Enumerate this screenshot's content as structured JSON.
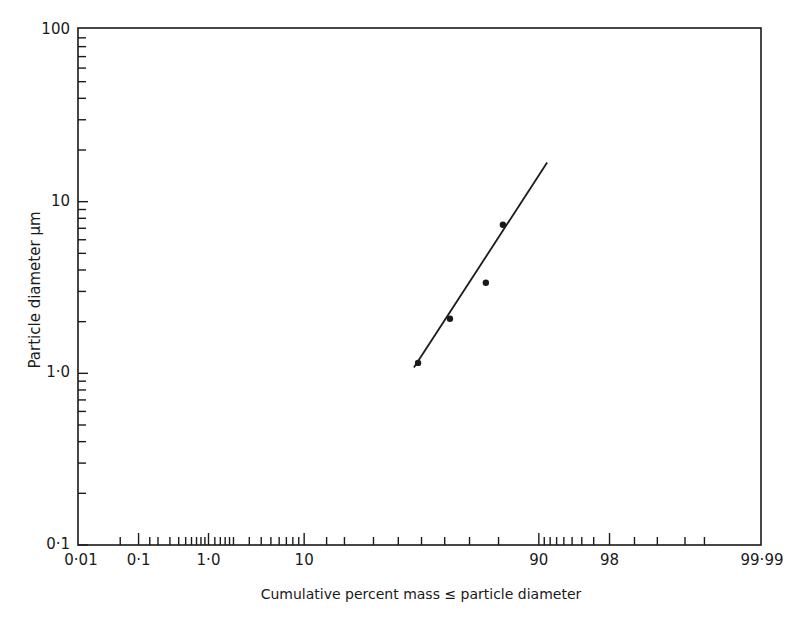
{
  "chart_data": {
    "type": "scatter",
    "title": "",
    "xlabel": "Cumulative percent mass ≤ particle diameter",
    "ylabel": "Particle diameter µm",
    "x_scale": "normal-probability",
    "y_scale": "log",
    "xlim": [
      0.01,
      99.99
    ],
    "ylim": [
      0.1,
      100
    ],
    "grid": false,
    "legend": null,
    "x_tick_labels": [
      {
        "value": 0.01,
        "label": "0·01"
      },
      {
        "value": 0.1,
        "label": "0·1"
      },
      {
        "value": 1.0,
        "label": "1·0"
      },
      {
        "value": 10,
        "label": "10"
      },
      {
        "value": 90,
        "label": "90"
      },
      {
        "value": 98,
        "label": "98"
      },
      {
        "value": 99.99,
        "label": "99·99"
      }
    ],
    "x_minor_ticks": [
      0.05,
      0.1,
      0.15,
      0.2,
      0.3,
      0.4,
      0.5,
      0.6,
      0.7,
      0.8,
      0.9,
      1.0,
      1.2,
      1.4,
      1.6,
      1.8,
      2.0,
      3,
      4,
      5,
      6,
      7,
      8,
      9,
      10,
      15,
      20,
      30,
      40,
      50,
      60,
      70,
      80,
      90,
      91,
      92,
      93,
      94,
      95,
      96,
      97,
      98,
      99,
      99.5,
      99.8,
      99.9
    ],
    "y_tick_labels": [
      {
        "value": 0.1,
        "label": "0·1"
      },
      {
        "value": 1.0,
        "label": "1·0"
      },
      {
        "value": 10,
        "label": "10"
      },
      {
        "value": 100,
        "label": "100"
      }
    ],
    "series": [
      {
        "name": "measured",
        "kind": "points",
        "x": [
          48.5,
          62.2,
          75.9,
          81.3
        ],
        "y": [
          1.15,
          2.08,
          3.37,
          7.34
        ]
      },
      {
        "name": "fitted line",
        "kind": "line",
        "x": [
          46.7,
          91.5
        ],
        "y": [
          1.08,
          16.9
        ]
      }
    ],
    "colors": {
      "ink": "#1a1a1a",
      "background": "#ffffff"
    }
  }
}
